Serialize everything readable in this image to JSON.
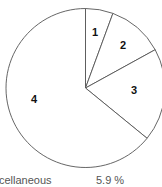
{
  "chart_data": {
    "type": "pie",
    "title": "",
    "start_angle_deg": 0,
    "direction": "clockwise",
    "slices": [
      {
        "label": "1",
        "percent": 5.6
      },
      {
        "label": "2",
        "percent": 11.4
      },
      {
        "label": "3",
        "percent": 18.9
      },
      {
        "label": "4",
        "percent": 64.1
      }
    ],
    "fill_color": "#ffffff",
    "stroke_color": "#555555",
    "legend": [
      {
        "label": "cellaneous",
        "value": "5.9 %"
      }
    ]
  },
  "footer": {
    "label": "cellaneous",
    "value": "5.9 %"
  }
}
